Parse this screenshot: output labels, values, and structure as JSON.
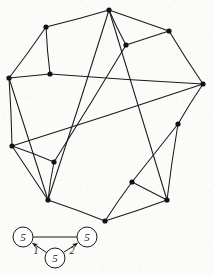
{
  "figure": {
    "kind": "hand-drawn-graph-diagram",
    "canvas": {
      "width": 214,
      "height": 276
    },
    "ink_color": "#1a1a1a",
    "paper_color": "#fbfbf9",
    "main_graph": {
      "name": "pentagram-in-polygon-graph",
      "vertex_count": 13,
      "edge_count": 24,
      "vertex_radius": 2.6,
      "vertices": [
        {
          "id": "v0",
          "x": 109,
          "y": 10,
          "label": ""
        },
        {
          "id": "v1",
          "x": 46,
          "y": 27,
          "label": ""
        },
        {
          "id": "v2",
          "x": 169,
          "y": 31,
          "label": ""
        },
        {
          "id": "v3",
          "x": 126,
          "y": 45,
          "label": ""
        },
        {
          "id": "v4",
          "x": 50,
          "y": 74,
          "label": ""
        },
        {
          "id": "v5",
          "x": 9,
          "y": 78,
          "label": ""
        },
        {
          "id": "v6",
          "x": 203,
          "y": 84,
          "label": ""
        },
        {
          "id": "v7",
          "x": 178,
          "y": 124,
          "label": ""
        },
        {
          "id": "v8",
          "x": 12,
          "y": 146,
          "label": ""
        },
        {
          "id": "v9",
          "x": 54,
          "y": 162,
          "label": ""
        },
        {
          "id": "v10",
          "x": 48,
          "y": 200,
          "label": ""
        },
        {
          "id": "v11",
          "x": 132,
          "y": 182,
          "label": ""
        },
        {
          "id": "v12",
          "x": 167,
          "y": 200,
          "label": ""
        },
        {
          "id": "v13",
          "x": 105,
          "y": 221,
          "label": ""
        }
      ],
      "edges": [
        {
          "from": "v0",
          "to": "v1"
        },
        {
          "from": "v0",
          "to": "v2"
        },
        {
          "from": "v0",
          "to": "v3"
        },
        {
          "from": "v0",
          "to": "v10"
        },
        {
          "from": "v0",
          "to": "v12"
        },
        {
          "from": "v1",
          "to": "v4"
        },
        {
          "from": "v1",
          "to": "v5"
        },
        {
          "from": "v2",
          "to": "v3"
        },
        {
          "from": "v2",
          "to": "v6"
        },
        {
          "from": "v3",
          "to": "v9"
        },
        {
          "from": "v4",
          "to": "v5"
        },
        {
          "from": "v4",
          "to": "v6"
        },
        {
          "from": "v5",
          "to": "v8"
        },
        {
          "from": "v5",
          "to": "v10"
        },
        {
          "from": "v6",
          "to": "v7"
        },
        {
          "from": "v6",
          "to": "v8"
        },
        {
          "from": "v7",
          "to": "v11"
        },
        {
          "from": "v7",
          "to": "v12"
        },
        {
          "from": "v8",
          "to": "v9"
        },
        {
          "from": "v8",
          "to": "v10"
        },
        {
          "from": "v9",
          "to": "v10"
        },
        {
          "from": "v10",
          "to": "v13"
        },
        {
          "from": "v11",
          "to": "v12"
        },
        {
          "from": "v11",
          "to": "v13"
        },
        {
          "from": "v12",
          "to": "v13"
        }
      ]
    },
    "inset_graph": {
      "name": "labeled-triangle-graph",
      "node_radius": 10,
      "nodes": [
        {
          "id": "n1",
          "x": 23,
          "y": 237,
          "label": "5"
        },
        {
          "id": "n2",
          "x": 87,
          "y": 237,
          "label": "5"
        },
        {
          "id": "n3",
          "x": 55,
          "y": 258,
          "label": "5"
        }
      ],
      "edges": [
        {
          "from": "n1",
          "to": "n2",
          "label": "",
          "arrow": false
        },
        {
          "from": "n3",
          "to": "n1",
          "label": "1",
          "arrow": true
        },
        {
          "from": "n3",
          "to": "n2",
          "label": "2",
          "arrow": true
        }
      ],
      "edge_labels": [
        {
          "text": "1",
          "x": 36,
          "y": 254
        },
        {
          "text": "2",
          "x": 72,
          "y": 254
        }
      ]
    }
  }
}
